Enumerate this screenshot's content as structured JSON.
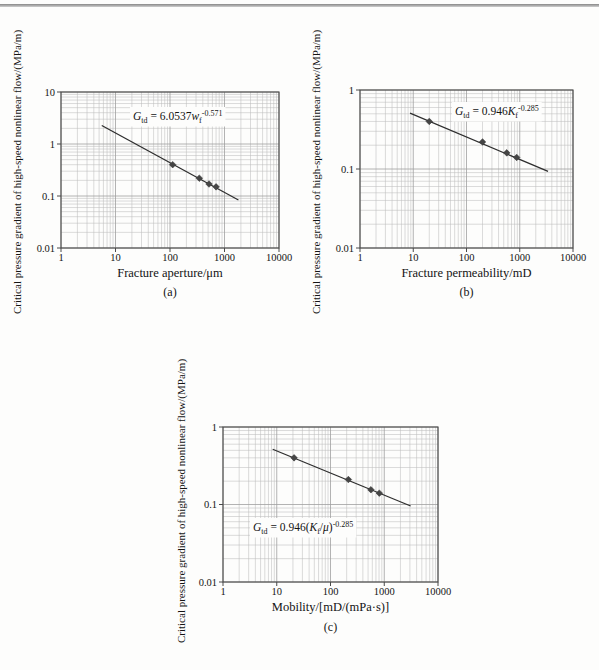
{
  "page": {
    "background": "#fdfdfc",
    "top_rule_color": "#878787"
  },
  "colors": {
    "grid_minor": "#bdbdbd",
    "grid_major": "#9f9f9f",
    "axis": "#4a4a4a",
    "fit_line": "#2e2e2e",
    "marker": "#454545",
    "text": "#141414"
  },
  "chart_data": [
    {
      "id": "a",
      "type": "scatter",
      "caption": "(a)",
      "xlabel": "Fracture aperture/μm",
      "ylabel": "Critical pressure gradient of high-speed nonlinear flow/(MPa/m)",
      "xlim": [
        1,
        10000
      ],
      "ylim": [
        0.01,
        10
      ],
      "x_ticks": [
        "1",
        "10",
        "100",
        "1000",
        "10000"
      ],
      "y_ticks": [
        "10",
        "1",
        "0.1",
        "0.01"
      ],
      "grid": "log-minor-both",
      "points": [
        [
          112,
          0.4
        ],
        [
          345,
          0.22
        ],
        [
          520,
          0.17
        ],
        [
          700,
          0.15
        ]
      ],
      "fit": {
        "coef": 6.0537,
        "exp": -0.571,
        "x_start": 5.6,
        "x_end": 1800
      },
      "equation_parts": [
        {
          "t": "G",
          "s": "i"
        },
        {
          "t": "td",
          "s": "sub"
        },
        {
          "t": " = 6.0537",
          "s": "n"
        },
        {
          "t": "w",
          "s": "i"
        },
        {
          "t": "f",
          "s": "sub"
        },
        {
          "t": "-0.571",
          "s": "sup"
        }
      ]
    },
    {
      "id": "b",
      "type": "scatter",
      "caption": "(b)",
      "xlabel": "Fracture permeability/mD",
      "ylabel": "Critical pressure gradient of high-speed nonlinear flow/(MPa/m)",
      "xlim": [
        1,
        10000
      ],
      "ylim": [
        0.01,
        1
      ],
      "x_ticks": [
        "1",
        "10",
        "100",
        "1000",
        "10000"
      ],
      "y_ticks": [
        "1",
        "0.1",
        "0.01"
      ],
      "grid": "log-minor-both",
      "points": [
        [
          20,
          0.4
        ],
        [
          200,
          0.22
        ],
        [
          570,
          0.16
        ],
        [
          875,
          0.14
        ]
      ],
      "fit": {
        "coef": 0.946,
        "exp": -0.285,
        "x_start": 8.7,
        "x_end": 3400
      },
      "equation_parts": [
        {
          "t": "G",
          "s": "i"
        },
        {
          "t": "td",
          "s": "sub"
        },
        {
          "t": " = 0.946",
          "s": "n"
        },
        {
          "t": "K",
          "s": "i"
        },
        {
          "t": "f",
          "s": "sub"
        },
        {
          "t": "-0.285",
          "s": "sup"
        }
      ]
    },
    {
      "id": "c",
      "type": "scatter",
      "caption": "(c)",
      "xlabel": "Mobility/[mD/(mPa·s)]",
      "ylabel": "Critical pressure gradient of high-speed nonlinear flow/(MPa/m)",
      "xlim": [
        1,
        10000
      ],
      "ylim": [
        0.01,
        1
      ],
      "x_ticks": [
        "1",
        "10",
        "100",
        "1000",
        "10000"
      ],
      "y_ticks": [
        "1",
        "0.1",
        "0.01"
      ],
      "grid": "log-minor-both",
      "points": [
        [
          21,
          0.4
        ],
        [
          215,
          0.21
        ],
        [
          565,
          0.155
        ],
        [
          810,
          0.14
        ]
      ],
      "fit": {
        "coef": 0.946,
        "exp": -0.285,
        "x_start": 8.4,
        "x_end": 3100
      },
      "equation_parts": [
        {
          "t": "G",
          "s": "i"
        },
        {
          "t": "td",
          "s": "sub"
        },
        {
          "t": " = 0.946(",
          "s": "n"
        },
        {
          "t": "K",
          "s": "i"
        },
        {
          "t": "f",
          "s": "sub"
        },
        {
          "t": "/",
          "s": "n"
        },
        {
          "t": "μ",
          "s": "i"
        },
        {
          "t": ")",
          "s": "n"
        },
        {
          "t": "-0.285",
          "s": "sup"
        }
      ]
    }
  ]
}
